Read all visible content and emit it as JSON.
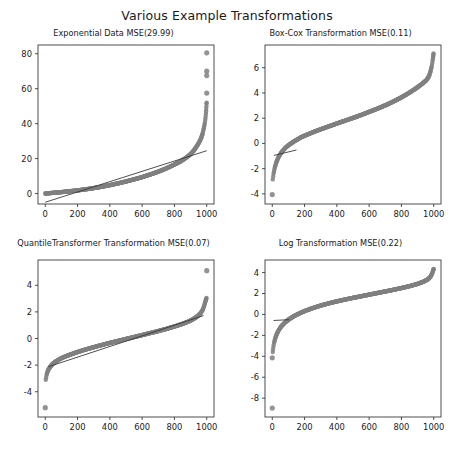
{
  "figure": {
    "suptitle": "Various Example Transformations",
    "background_color": "#ffffff",
    "marker_color": "#808080",
    "line_color": "#3a3a3a",
    "axis_color": "#3a3a3a"
  },
  "subplots": [
    {
      "key": "exponential",
      "title": "Exponential Data MSE(29.99)",
      "position": "top-left"
    },
    {
      "key": "boxcox",
      "title": "Box-Cox Transformation MSE(0.11)",
      "position": "top-right"
    },
    {
      "key": "quantile",
      "title": "QuantileTransformer Transformation MSE(0.07)",
      "position": "bottom-left"
    },
    {
      "key": "log",
      "title": "Log Transformation MSE(0.22)",
      "position": "bottom-right"
    }
  ],
  "chart_data": [
    {
      "type": "scatter",
      "key": "exponential",
      "title": "Exponential Data MSE(29.99)",
      "xlabel": "",
      "ylabel": "",
      "xlim": [
        -45,
        1045
      ],
      "ylim": [
        -6,
        85
      ],
      "xticks": [
        0,
        200,
        400,
        600,
        800,
        1000
      ],
      "xticklabels": [
        "0",
        "200",
        "400",
        "600",
        "800",
        "1000"
      ],
      "yticks": [
        0,
        20,
        40,
        60,
        80
      ],
      "yticklabels": [
        "0",
        "20",
        "40",
        "60",
        "80"
      ],
      "grid": false,
      "legend": null,
      "series": [
        {
          "name": "sorted exponential sample",
          "marker": "circle",
          "color": "#808080",
          "description": "Sorted exponentially distributed values, index on x axis, value on y axis. Rises slowly then steeply after index 900.",
          "x": [
            0,
            10,
            25,
            50,
            75,
            100,
            150,
            200,
            250,
            300,
            350,
            400,
            450,
            500,
            550,
            600,
            650,
            700,
            750,
            800,
            830,
            860,
            880,
            900,
            920,
            940,
            955,
            965,
            975,
            982,
            988,
            992,
            995,
            997,
            999,
            1000
          ],
          "y": [
            0.0,
            0.1,
            0.2,
            0.4,
            0.6,
            0.8,
            1.3,
            1.8,
            2.4,
            3.1,
            3.9,
            4.8,
            5.8,
            6.9,
            8.1,
            9.4,
            10.9,
            12.5,
            14.4,
            16.6,
            18.0,
            19.7,
            21.0,
            22.6,
            24.6,
            27.3,
            29.6,
            31.7,
            34.5,
            37.4,
            40.3,
            43.0,
            45.8,
            48.5,
            51.5,
            52.5
          ]
        },
        {
          "name": "outliers",
          "marker": "circle",
          "color": "#808080",
          "description": "Three high outlier clusters near index 1000",
          "x": [
            1000,
            1000,
            1000,
            1000
          ],
          "y": [
            80.5,
            70.0,
            67.5,
            57.5
          ]
        },
        {
          "name": "linear fit",
          "type": "line",
          "color": "#3a3a3a",
          "description": "Least squares regression line over the scatter",
          "x": [
            0,
            1000
          ],
          "y": [
            -5.0,
            24.5
          ]
        }
      ]
    },
    {
      "type": "scatter",
      "key": "boxcox",
      "title": "Box-Cox Transformation MSE(0.11)",
      "xlabel": "",
      "ylabel": "",
      "xlim": [
        -45,
        1045
      ],
      "ylim": [
        -4.8,
        7.8
      ],
      "xticks": [
        0,
        200,
        400,
        600,
        800,
        1000
      ],
      "xticklabels": [
        "0",
        "200",
        "400",
        "600",
        "800",
        "1000"
      ],
      "yticks": [
        -4,
        -2,
        0,
        2,
        4,
        6
      ],
      "yticklabels": [
        "-4",
        "-2",
        "0",
        "2",
        "4",
        "6"
      ],
      "grid": false,
      "legend": null,
      "series": [
        {
          "name": "box-cox transformed sample",
          "marker": "circle",
          "color": "#808080",
          "description": "Box-Cox transformed sorted values; steep rise at low index, near-linear middle, steep rise at high index.",
          "x": [
            3,
            8,
            15,
            25,
            40,
            60,
            85,
            110,
            140,
            180,
            220,
            260,
            300,
            350,
            400,
            450,
            500,
            550,
            600,
            650,
            700,
            750,
            800,
            840,
            880,
            910,
            935,
            955,
            970,
            980,
            988,
            993,
            996,
            998,
            1000
          ],
          "y": [
            -2.85,
            -2.4,
            -1.95,
            -1.5,
            -1.05,
            -0.65,
            -0.3,
            -0.05,
            0.2,
            0.5,
            0.72,
            0.93,
            1.12,
            1.35,
            1.58,
            1.8,
            2.02,
            2.25,
            2.5,
            2.75,
            3.02,
            3.32,
            3.65,
            3.95,
            4.28,
            4.55,
            4.8,
            5.02,
            5.3,
            5.7,
            6.15,
            6.55,
            6.85,
            7.05,
            7.2
          ]
        },
        {
          "name": "outlier",
          "marker": "circle",
          "color": "#808080",
          "description": "Single low outlier at index 0",
          "x": [
            0
          ],
          "y": [
            -4.05
          ]
        },
        {
          "name": "linear fit",
          "type": "line",
          "color": "#3a3a3a",
          "description": "Short regression segment visible near the lower-left of the cloud",
          "x": [
            10,
            150
          ],
          "y": [
            -0.95,
            -0.52
          ]
        }
      ]
    },
    {
      "type": "scatter",
      "key": "quantile",
      "title": "QuantileTransformer Transformation MSE(0.07)",
      "xlabel": "",
      "ylabel": "",
      "xlim": [
        -45,
        1045
      ],
      "ylim": [
        -5.9,
        5.9
      ],
      "xticks": [
        0,
        200,
        400,
        600,
        800,
        1000
      ],
      "xticklabels": [
        "0",
        "200",
        "400",
        "600",
        "800",
        "1000"
      ],
      "yticks": [
        -4,
        -2,
        0,
        2,
        4
      ],
      "yticklabels": [
        "-4",
        "-2",
        "0",
        "2",
        "4"
      ],
      "grid": false,
      "legend": null,
      "series": [
        {
          "name": "quantile transformed sample",
          "marker": "circle",
          "color": "#808080",
          "description": "Normal-quantile transformed sorted values forming a sigmoid / inverse-normal CDF curve.",
          "x": [
            3,
            8,
            14,
            22,
            32,
            45,
            62,
            85,
            110,
            145,
            185,
            230,
            280,
            340,
            400,
            460,
            520,
            580,
            640,
            700,
            755,
            805,
            850,
            888,
            920,
            945,
            962,
            975,
            984,
            990,
            994,
            997,
            1000
          ],
          "y": [
            -3.1,
            -2.75,
            -2.5,
            -2.28,
            -2.1,
            -1.92,
            -1.75,
            -1.58,
            -1.42,
            -1.25,
            -1.08,
            -0.9,
            -0.72,
            -0.52,
            -0.33,
            -0.15,
            0.02,
            0.2,
            0.38,
            0.56,
            0.74,
            0.92,
            1.1,
            1.28,
            1.48,
            1.7,
            1.9,
            2.15,
            2.45,
            2.7,
            2.88,
            3.0,
            3.08
          ]
        },
        {
          "name": "outliers",
          "marker": "circle",
          "color": "#808080",
          "description": "One low outlier at index 0 and one high outlier at index 1000",
          "x": [
            0,
            1000
          ],
          "y": [
            -5.2,
            5.1
          ]
        },
        {
          "name": "linear fit",
          "type": "line",
          "color": "#3a3a3a",
          "description": "Regression line overlapping the central portion of the curve",
          "x": [
            20,
            980
          ],
          "y": [
            -2.12,
            1.72
          ]
        }
      ]
    },
    {
      "type": "scatter",
      "key": "log",
      "title": "Log Transformation MSE(0.22)",
      "xlabel": "",
      "ylabel": "",
      "xlim": [
        -45,
        1045
      ],
      "ylim": [
        -9.8,
        5.2
      ],
      "xticks": [
        0,
        200,
        400,
        600,
        800,
        1000
      ],
      "xticklabels": [
        "0",
        "200",
        "400",
        "600",
        "800",
        "1000"
      ],
      "yticks": [
        -8,
        -6,
        -4,
        -2,
        0,
        2,
        4
      ],
      "yticklabels": [
        "-8",
        "-6",
        "-4",
        "-2",
        "0",
        "2",
        "4"
      ],
      "grid": false,
      "legend": null,
      "series": [
        {
          "name": "log transformed sample",
          "marker": "circle",
          "color": "#808080",
          "description": "Log transformed sorted values: sharp rise from about -3.6 at low index then slow logarithmic growth to about 4.",
          "x": [
            3,
            7,
            12,
            20,
            30,
            42,
            58,
            78,
            100,
            130,
            165,
            205,
            250,
            300,
            360,
            420,
            480,
            545,
            610,
            675,
            740,
            800,
            855,
            900,
            935,
            960,
            975,
            985,
            992,
            996,
            999,
            1000
          ],
          "y": [
            -3.6,
            -3.1,
            -2.65,
            -2.2,
            -1.8,
            -1.45,
            -1.1,
            -0.78,
            -0.5,
            -0.2,
            0.08,
            0.35,
            0.6,
            0.85,
            1.1,
            1.32,
            1.52,
            1.72,
            1.92,
            2.12,
            2.32,
            2.52,
            2.72,
            2.92,
            3.12,
            3.32,
            3.52,
            3.75,
            3.98,
            4.18,
            4.32,
            4.38
          ]
        },
        {
          "name": "outliers",
          "marker": "circle",
          "color": "#808080",
          "description": "Two low outliers at index 0",
          "x": [
            0,
            0
          ],
          "y": [
            -4.15,
            -8.95
          ]
        },
        {
          "name": "linear fit",
          "type": "line",
          "color": "#3a3a3a",
          "description": "Short regression segment near the lower-left of the cloud",
          "x": [
            8,
            105
          ],
          "y": [
            -0.58,
            -0.5
          ]
        }
      ]
    }
  ]
}
